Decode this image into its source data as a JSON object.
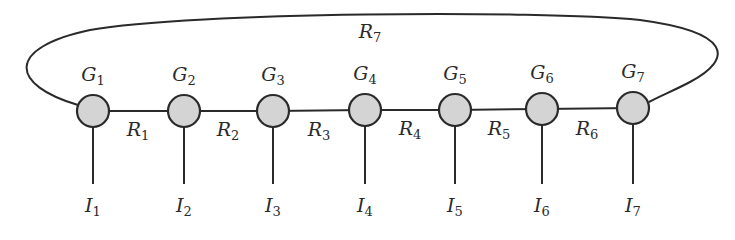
{
  "diagram": {
    "type": "ring-network",
    "colors": {
      "node_fill": "#d4d4d4",
      "stroke": "#2a2a2a",
      "background": "#ffffff"
    },
    "nodes": [
      {
        "id": "G1",
        "symbol": "G",
        "sub": "1",
        "x": 93,
        "y": 111
      },
      {
        "id": "G2",
        "symbol": "G",
        "sub": "2",
        "x": 184,
        "y": 111
      },
      {
        "id": "G3",
        "symbol": "G",
        "sub": "3",
        "x": 273,
        "y": 111
      },
      {
        "id": "G4",
        "symbol": "G",
        "sub": "4",
        "x": 365,
        "y": 110
      },
      {
        "id": "G5",
        "symbol": "G",
        "sub": "5",
        "x": 455,
        "y": 110
      },
      {
        "id": "G6",
        "symbol": "G",
        "sub": "6",
        "x": 542,
        "y": 109
      },
      {
        "id": "G7",
        "symbol": "G",
        "sub": "7",
        "x": 633,
        "y": 108
      }
    ],
    "edges": [
      {
        "id": "R1",
        "symbol": "R",
        "sub": "1",
        "from": "G1",
        "to": "G2",
        "lx": 138,
        "ly": 120
      },
      {
        "id": "R2",
        "symbol": "R",
        "sub": "2",
        "from": "G2",
        "to": "G3",
        "lx": 228,
        "ly": 120
      },
      {
        "id": "R3",
        "symbol": "R",
        "sub": "3",
        "from": "G3",
        "to": "G4",
        "lx": 319,
        "ly": 120
      },
      {
        "id": "R4",
        "symbol": "R",
        "sub": "4",
        "from": "G4",
        "to": "G5",
        "lx": 410,
        "ly": 119
      },
      {
        "id": "R5",
        "symbol": "R",
        "sub": "5",
        "from": "G5",
        "to": "G6",
        "lx": 499,
        "ly": 119
      },
      {
        "id": "R6",
        "symbol": "R",
        "sub": "6",
        "from": "G6",
        "to": "G7",
        "lx": 587,
        "ly": 119
      },
      {
        "id": "R7",
        "symbol": "R",
        "sub": "7",
        "from": "G7",
        "to": "G1",
        "lx": 370,
        "ly": 22
      }
    ],
    "inputs": [
      {
        "id": "I1",
        "symbol": "I",
        "sub": "1",
        "node": "G1"
      },
      {
        "id": "I2",
        "symbol": "I",
        "sub": "2",
        "node": "G2"
      },
      {
        "id": "I3",
        "symbol": "I",
        "sub": "3",
        "node": "G3"
      },
      {
        "id": "I4",
        "symbol": "I",
        "sub": "4",
        "node": "G4"
      },
      {
        "id": "I5",
        "symbol": "I",
        "sub": "5",
        "node": "G5"
      },
      {
        "id": "I6",
        "symbol": "I",
        "sub": "6",
        "node": "G6"
      },
      {
        "id": "I7",
        "symbol": "I",
        "sub": "7",
        "node": "G7"
      }
    ]
  }
}
